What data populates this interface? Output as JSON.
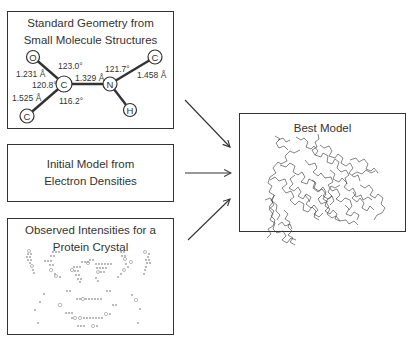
{
  "boxes": {
    "geometry": {
      "title_line1": "Standard Geometry from",
      "title_line2": "Small Molecule Structures",
      "molecule": {
        "atoms": [
          {
            "label": "O",
            "x": 33,
            "y": 57
          },
          {
            "label": "C",
            "x": 64,
            "y": 84
          },
          {
            "label": "N",
            "x": 110,
            "y": 84
          },
          {
            "label": "C",
            "x": 155,
            "y": 57
          },
          {
            "label": "H",
            "x": 130,
            "y": 110
          },
          {
            "label": "C",
            "x": 27,
            "y": 116
          }
        ],
        "bond_lengths": {
          "c_o": "1.231 Å",
          "c_n": "1.329 Å",
          "n_c": "1.458 Å",
          "c_c": "1.525 Å"
        },
        "angles": {
          "o_c_n": "123.0°",
          "o_c_c": "120.8°",
          "c_c_n": "116.2°",
          "c_n_c": "121.7°"
        }
      }
    },
    "electron": {
      "title_line1": "Initial Model from",
      "title_line2": "Electron Densities"
    },
    "intensities": {
      "title_line1": "Observed Intensities for a",
      "title_line2": "Protein Crystal"
    },
    "best_model": {
      "title": "Best Model"
    }
  },
  "arrows": [
    {
      "from": "geometry",
      "to": "best_model"
    },
    {
      "from": "electron",
      "to": "best_model"
    },
    {
      "from": "intensities",
      "to": "best_model"
    }
  ],
  "colors": {
    "line": "#333333",
    "background": "#ffffff",
    "diffraction_spots": "#9a9a9a"
  }
}
